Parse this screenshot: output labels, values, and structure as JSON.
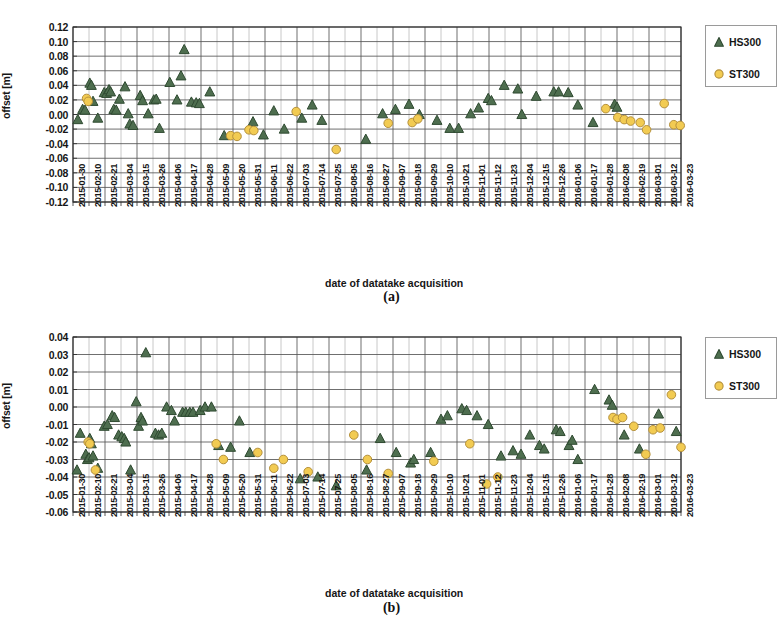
{
  "figure": {
    "captions": [
      "(a)",
      "(b)"
    ],
    "colors": {
      "hs300": "#4e6e4f",
      "hs300_edge": "#2f4a31",
      "st300": "#f2cb52",
      "st300_edge": "#b5903a",
      "grid_major": "#555555",
      "grid_minor": "#9b9b9b",
      "axis": "#2b2b2b",
      "text": "#161616"
    }
  },
  "legend": {
    "entries": [
      {
        "label": "HS300",
        "marker": "triangle-marker",
        "color": "#4e6e4f"
      },
      {
        "label": "ST300",
        "marker": "circle-marker",
        "color": "#f2cb52"
      }
    ]
  },
  "axis_labels": {
    "y": "offset [m]",
    "x": "date of datatake acquisition"
  },
  "x_categories": [
    "2015-01-30",
    "2015-02-10",
    "2015-02-21",
    "2015-03-04",
    "2015-03-15",
    "2015-03-26",
    "2015-04-06",
    "2015-04-17",
    "2015-04-28",
    "2015-05-09",
    "2015-05-20",
    "2015-05-31",
    "2015-06-11",
    "2015-06-22",
    "2015-07-03",
    "2015-07-14",
    "2015-07-25",
    "2015-08-05",
    "2015-08-16",
    "2015-08-27",
    "2015-09-07",
    "2015-09-18",
    "2015-09-29",
    "2015-10-10",
    "2015-10-21",
    "2015-11-01",
    "2015-11-12",
    "2015-11-23",
    "2015-12-04",
    "2015-12-15",
    "2015-12-26",
    "2016-01-06",
    "2016-01-17",
    "2016-01-28",
    "2016-02-08",
    "2016-02-19",
    "2016-03-01",
    "2016-03-12",
    "2016-03-23"
  ],
  "chart_data": [
    {
      "id": "panel-a",
      "type": "scatter",
      "title": "(a)",
      "xlabel": "date of datatake acquisition",
      "ylabel": "offset [m]",
      "ylim": [
        -0.12,
        0.12
      ],
      "ytick_step": 0.02,
      "yticks": [
        0.12,
        0.1,
        0.08,
        0.06,
        0.04,
        0.02,
        0.0,
        -0.02,
        -0.04,
        -0.06,
        -0.08,
        -0.1,
        -0.12
      ],
      "ytick_labels": [
        "0.12",
        "0.10",
        "0.08",
        "0.06",
        "0.04",
        "0.02",
        "0.00",
        "-0.02",
        "-0.04",
        "-0.06",
        "-0.08",
        "-0.10",
        "-0.12"
      ],
      "xlim": [
        0,
        38
      ],
      "grid": true,
      "legend_position": "right",
      "series": [
        {
          "name": "HS300",
          "marker": "triangle",
          "color": "#4e6e4f",
          "points": [
            [
              0.3,
              -0.007
            ],
            [
              0.6,
              0.007
            ],
            [
              0.75,
              0.006
            ],
            [
              1.05,
              0.043
            ],
            [
              1.15,
              0.04
            ],
            [
              1.25,
              0.018
            ],
            [
              1.55,
              -0.005
            ],
            [
              1.95,
              0.03
            ],
            [
              2.1,
              0.029
            ],
            [
              2.25,
              0.034
            ],
            [
              2.35,
              0.031
            ],
            [
              2.55,
              0.007
            ],
            [
              2.7,
              0.006
            ],
            [
              2.9,
              0.021
            ],
            [
              3.25,
              0.038
            ],
            [
              3.45,
              0.001
            ],
            [
              3.55,
              -0.013
            ],
            [
              3.75,
              -0.015
            ],
            [
              4.2,
              0.026
            ],
            [
              4.35,
              0.019
            ],
            [
              4.7,
              0.001
            ],
            [
              5.05,
              0.02
            ],
            [
              5.2,
              0.021
            ],
            [
              5.4,
              -0.019
            ],
            [
              6.05,
              0.044
            ],
            [
              6.5,
              0.02
            ],
            [
              6.75,
              0.053
            ],
            [
              6.95,
              0.089
            ],
            [
              7.4,
              0.017
            ],
            [
              7.7,
              0.016
            ],
            [
              7.9,
              0.015
            ],
            [
              8.55,
              0.031
            ],
            [
              9.45,
              -0.029
            ],
            [
              11.25,
              -0.01
            ],
            [
              11.9,
              -0.028
            ],
            [
              12.55,
              0.005
            ],
            [
              13.2,
              -0.02
            ],
            [
              14.3,
              -0.005
            ],
            [
              14.95,
              0.013
            ],
            [
              15.55,
              -0.008
            ],
            [
              18.3,
              -0.034
            ],
            [
              19.35,
              0.001
            ],
            [
              20.15,
              0.007
            ],
            [
              21.0,
              0.014
            ],
            [
              21.65,
              0.0
            ],
            [
              22.75,
              -0.008
            ],
            [
              23.55,
              -0.019
            ],
            [
              24.1,
              -0.019
            ],
            [
              24.85,
              0.001
            ],
            [
              25.35,
              0.009
            ],
            [
              25.95,
              0.022
            ],
            [
              26.15,
              0.019
            ],
            [
              26.95,
              0.04
            ],
            [
              27.8,
              0.035
            ],
            [
              28.05,
              0.0
            ],
            [
              28.95,
              0.025
            ],
            [
              30.05,
              0.031
            ],
            [
              30.35,
              0.031
            ],
            [
              30.95,
              0.03
            ],
            [
              31.55,
              0.013
            ],
            [
              32.5,
              -0.011
            ],
            [
              33.85,
              0.014
            ],
            [
              34.0,
              0.01
            ]
          ]
        },
        {
          "name": "ST300",
          "marker": "circle",
          "color": "#f2cb52",
          "points": [
            [
              0.85,
              0.022
            ],
            [
              0.95,
              0.018
            ],
            [
              9.85,
              -0.029
            ],
            [
              10.25,
              -0.03
            ],
            [
              11.0,
              -0.021
            ],
            [
              11.3,
              -0.022
            ],
            [
              13.95,
              0.004
            ],
            [
              16.45,
              -0.048
            ],
            [
              19.7,
              -0.012
            ],
            [
              21.2,
              -0.011
            ],
            [
              21.55,
              -0.006
            ],
            [
              33.3,
              0.008
            ],
            [
              34.05,
              -0.004
            ],
            [
              34.45,
              -0.007
            ],
            [
              34.85,
              -0.009
            ],
            [
              35.45,
              -0.011
            ],
            [
              35.85,
              -0.021
            ],
            [
              36.95,
              0.015
            ],
            [
              37.55,
              -0.014
            ],
            [
              37.95,
              -0.015
            ]
          ]
        }
      ]
    },
    {
      "id": "panel-b",
      "type": "scatter",
      "title": "(b)",
      "xlabel": "date of datatake acquisition",
      "ylabel": "offset [m]",
      "ylim": [
        -0.06,
        0.04
      ],
      "ytick_step": 0.01,
      "yticks": [
        0.04,
        0.03,
        0.02,
        0.01,
        0.0,
        -0.01,
        -0.02,
        -0.03,
        -0.04,
        -0.05,
        -0.06
      ],
      "ytick_labels": [
        "0.04",
        "0.03",
        "0.02",
        "0.01",
        "0.00",
        "-0.01",
        "-0.02",
        "-0.03",
        "-0.04",
        "-0.05",
        "-0.06"
      ],
      "xlim": [
        0,
        38
      ],
      "grid": true,
      "legend_position": "right",
      "series": [
        {
          "name": "HS300",
          "marker": "triangle",
          "color": "#4e6e4f",
          "points": [
            [
              0.25,
              -0.036
            ],
            [
              0.45,
              -0.015
            ],
            [
              0.8,
              -0.027
            ],
            [
              0.9,
              -0.03
            ],
            [
              1.0,
              -0.029
            ],
            [
              1.05,
              -0.018
            ],
            [
              1.15,
              -0.021
            ],
            [
              1.25,
              -0.028
            ],
            [
              1.55,
              -0.035
            ],
            [
              1.95,
              -0.011
            ],
            [
              2.15,
              -0.01
            ],
            [
              2.45,
              -0.005
            ],
            [
              2.6,
              -0.006
            ],
            [
              2.85,
              -0.016
            ],
            [
              3.05,
              -0.017
            ],
            [
              3.2,
              -0.018
            ],
            [
              3.3,
              -0.02
            ],
            [
              3.6,
              -0.036
            ],
            [
              3.95,
              0.003
            ],
            [
              4.1,
              -0.011
            ],
            [
              4.25,
              -0.006
            ],
            [
              4.35,
              -0.008
            ],
            [
              4.55,
              0.031
            ],
            [
              5.15,
              -0.015
            ],
            [
              5.35,
              -0.016
            ],
            [
              5.55,
              -0.015
            ],
            [
              5.85,
              0.0
            ],
            [
              6.15,
              -0.002
            ],
            [
              6.35,
              -0.008
            ],
            [
              6.85,
              -0.003
            ],
            [
              7.05,
              -0.003
            ],
            [
              7.3,
              -0.003
            ],
            [
              7.5,
              -0.003
            ],
            [
              7.95,
              -0.002
            ],
            [
              8.25,
              0.0
            ],
            [
              8.65,
              0.0
            ],
            [
              9.1,
              -0.022
            ],
            [
              9.85,
              -0.023
            ],
            [
              10.4,
              -0.008
            ],
            [
              11.05,
              -0.026
            ],
            [
              14.2,
              -0.041
            ],
            [
              15.3,
              -0.04
            ],
            [
              16.45,
              -0.045
            ],
            [
              18.35,
              -0.036
            ],
            [
              19.2,
              -0.018
            ],
            [
              20.2,
              -0.026
            ],
            [
              21.1,
              -0.032
            ],
            [
              21.3,
              -0.03
            ],
            [
              22.35,
              -0.026
            ],
            [
              23.0,
              -0.007
            ],
            [
              23.4,
              -0.005
            ],
            [
              24.3,
              -0.001
            ],
            [
              24.6,
              -0.002
            ],
            [
              25.25,
              -0.005
            ],
            [
              25.95,
              -0.01
            ],
            [
              26.75,
              -0.028
            ],
            [
              27.5,
              -0.025
            ],
            [
              28.0,
              -0.027
            ],
            [
              28.55,
              -0.016
            ],
            [
              29.15,
              -0.022
            ],
            [
              29.45,
              -0.024
            ],
            [
              30.2,
              -0.013
            ],
            [
              30.45,
              -0.014
            ],
            [
              31.0,
              -0.022
            ],
            [
              31.2,
              -0.019
            ],
            [
              31.55,
              -0.03
            ],
            [
              32.6,
              0.01
            ],
            [
              33.5,
              0.004
            ],
            [
              33.7,
              0.001
            ],
            [
              34.45,
              -0.016
            ],
            [
              35.4,
              -0.024
            ],
            [
              36.6,
              -0.004
            ],
            [
              37.7,
              -0.014
            ]
          ]
        },
        {
          "name": "ST300",
          "marker": "circle",
          "color": "#f2cb52",
          "points": [
            [
              0.95,
              -0.02
            ],
            [
              1.05,
              -0.021
            ],
            [
              1.4,
              -0.036
            ],
            [
              8.95,
              -0.021
            ],
            [
              9.4,
              -0.03
            ],
            [
              11.55,
              -0.026
            ],
            [
              12.55,
              -0.035
            ],
            [
              13.15,
              -0.03
            ],
            [
              14.7,
              -0.037
            ],
            [
              17.55,
              -0.016
            ],
            [
              18.4,
              -0.03
            ],
            [
              19.7,
              -0.038
            ],
            [
              22.55,
              -0.031
            ],
            [
              24.8,
              -0.021
            ],
            [
              25.85,
              -0.044
            ],
            [
              26.55,
              -0.04
            ],
            [
              33.75,
              -0.006
            ],
            [
              34.0,
              -0.007
            ],
            [
              34.35,
              -0.006
            ],
            [
              35.05,
              -0.011
            ],
            [
              35.8,
              -0.027
            ],
            [
              36.25,
              -0.013
            ],
            [
              36.7,
              -0.012
            ],
            [
              37.4,
              0.007
            ],
            [
              38.0,
              -0.023
            ]
          ]
        }
      ]
    }
  ]
}
